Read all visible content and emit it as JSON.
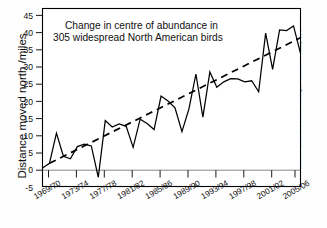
{
  "chart_data": {
    "type": "line",
    "title_lines": [
      "Change in centre of abundance in",
      "305 widespread North American birds"
    ],
    "xlabel": "",
    "ylabel": "Distance moved north  /miles",
    "ylim": [
      -5,
      45
    ],
    "yticks": [
      -5,
      0,
      5,
      10,
      15,
      20,
      25,
      30,
      35,
      40,
      45
    ],
    "ytick_labels": [
      "-5",
      "0",
      "5",
      "10",
      "15",
      "20",
      "25",
      "30",
      "35",
      "40",
      "45"
    ],
    "xtick_labels": [
      "1969/70",
      "1973/74",
      "1977/78",
      "1981/82",
      "1985/86",
      "1989/90",
      "1993/94",
      "1997/98",
      "2001/02",
      "2005/06"
    ],
    "xtick_years": [
      1969,
      1973,
      1977,
      1981,
      1985,
      1989,
      1993,
      1997,
      2001,
      2005
    ],
    "xlim": [
      1969,
      2006
    ],
    "grid": false,
    "legend": "none",
    "source_note": "Source: Birds and climate change, Audubon Society 2009",
    "series": [
      {
        "name": "Distance moved north",
        "style": "solid",
        "x": [
          1969,
          1970,
          1971,
          1972,
          1973,
          1974,
          1975,
          1976,
          1977,
          1978,
          1979,
          1980,
          1981,
          1982,
          1983,
          1984,
          1985,
          1986,
          1987,
          1988,
          1989,
          1990,
          1991,
          1992,
          1993,
          1994,
          1995,
          1996,
          1997,
          1998,
          1999,
          2000,
          2001,
          2002,
          2003,
          2004,
          2005,
          2006
        ],
        "values": [
          0.2,
          1.5,
          10.0,
          3.5,
          2.8,
          6.2,
          6.9,
          6.4,
          -2.4,
          13.5,
          11.7,
          12.6,
          11.9,
          6.0,
          13.9,
          12.7,
          11.0,
          20.4,
          19.0,
          17.1,
          10.4,
          16.8,
          26.6,
          14.5,
          27.2,
          22.9,
          24.4,
          25.3,
          25.2,
          24.4,
          24.7,
          21.6,
          38.1,
          27.9,
          39.0,
          38.8,
          40.1,
          32.4
        ],
        "final_value": 40.0
      },
      {
        "name": "Linear trend",
        "style": "dashed",
        "x": [
          1970,
          2006
        ],
        "values": [
          1.5,
          36.8
        ]
      }
    ]
  },
  "axis": {
    "y_axis_name": "y-axis",
    "x_axis_name": "x-axis"
  }
}
